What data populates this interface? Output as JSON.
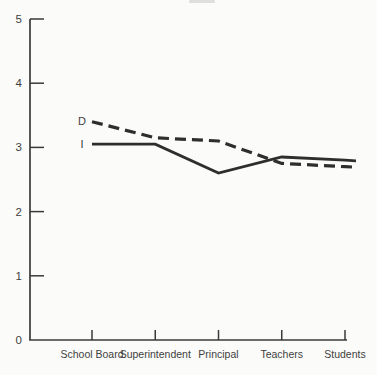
{
  "figure": {
    "background": "#fbfbf9",
    "ink_color": "#2e2e2e",
    "axis_color": "#3a3a3a",
    "label_color": "#3f3f3f"
  },
  "chart_data": {
    "type": "line",
    "title": "",
    "xlabel": "",
    "ylabel": "",
    "categories": [
      "School Board",
      "Superintendent",
      "Principal",
      "Teachers",
      "Students"
    ],
    "series": [
      {
        "name": "D",
        "style": "dashed",
        "values": [
          3.4,
          3.15,
          3.1,
          2.75,
          2.7
        ]
      },
      {
        "name": "I",
        "style": "solid",
        "values": [
          3.05,
          3.05,
          2.6,
          2.85,
          2.8
        ]
      }
    ],
    "ylim": [
      0,
      5
    ],
    "yticks": [
      0,
      1,
      2,
      3,
      4,
      5
    ],
    "grid": false,
    "legend_position": "inline-left-of-first-points"
  }
}
